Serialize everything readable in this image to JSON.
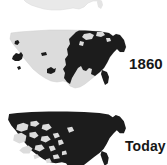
{
  "figure": {
    "background_color": "#ffffff",
    "settled_color": "#1c1c1c",
    "unsettled_color": "#dcdcdc",
    "faint_color": "#e9e9e9"
  },
  "maps": [
    {
      "id": "early",
      "label": "",
      "note": "faint light-gray United States outline, cropped by the top edge of the frame",
      "fill": "#e9e9e9",
      "outline": "#d2d2d2",
      "settled_regions": []
    },
    {
      "id": "1860",
      "label": "1860",
      "note": "eastern United States filled dark (settled); western territory light gray (unsettled) with a few isolated dark settlement blobs",
      "fill": "#dcdcdc",
      "settled_fill": "#1c1c1c",
      "settled_regions": [
        "eastern seaboard",
        "Great Lakes",
        "Ohio valley",
        "Deep South",
        "Texas",
        "California gold country",
        "Oregon",
        "Utah",
        "New Mexico"
      ]
    },
    {
      "id": "today",
      "label": "Today",
      "note": "nearly the whole country filled dark (settled); scattered light gray pockets remain in the mountain west and Great Basin; cropped by the bottom edge of the frame",
      "fill": "#dcdcdc",
      "settled_fill": "#1c1c1c",
      "unsettled_pockets": [
        "Great Basin",
        "Nevada",
        "Idaho",
        "Arizona",
        "Wyoming"
      ]
    }
  ],
  "labels": {
    "map_1860": "1860",
    "map_today": "Today"
  }
}
